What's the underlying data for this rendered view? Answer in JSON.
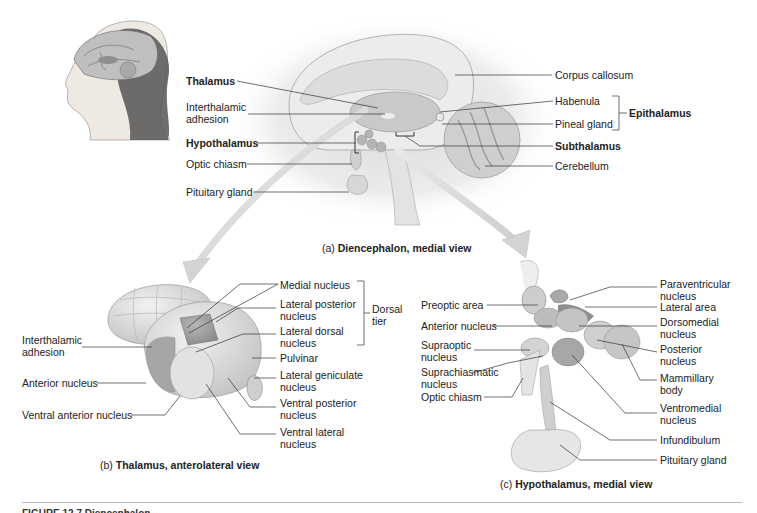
{
  "figure": {
    "caption_cut": "FIGURE 12.7 Diencephalon.",
    "colors": {
      "background": "#ffffff",
      "tissue_light": "#e6e6e6",
      "tissue_mid": "#c8c8c8",
      "tissue_dark": "#9a9a9a",
      "leader_line": "#333333",
      "arrow_fill": "#dcdcdc"
    }
  },
  "panel_a": {
    "caption_prefix": "(a)",
    "caption_bold": "Diencephalon, medial view",
    "labels_left": {
      "thalamus": "Thalamus",
      "interthalamic_adhesion": "Interthalamic\nadhesion",
      "hypothalamus": "Hypothalamus",
      "optic_chiasm": "Optic chiasm",
      "pituitary_gland": "Pituitary gland"
    },
    "labels_right": {
      "corpus_callosum": "Corpus callosum",
      "habenula": "Habenula",
      "pineal_gland": "Pineal gland",
      "epithalamus": "Epithalamus",
      "subthalamus": "Subthalamus",
      "cerebellum": "Cerebellum"
    }
  },
  "panel_b": {
    "caption_prefix": "(b)",
    "caption_bold": "Thalamus, anterolateral view",
    "labels_left": {
      "interthalamic_adhesion": "Interthalamic\nadhesion",
      "anterior_nucleus": "Anterior nucleus",
      "ventral_anterior_nucleus": "Ventral anterior nucleus"
    },
    "labels_right": {
      "medial_nucleus": "Medial nucleus",
      "lateral_posterior_nucleus": "Lateral posterior\nnucleus",
      "lateral_dorsal_nucleus": "Lateral dorsal\nnucleus",
      "pulvinar": "Pulvinar",
      "lateral_geniculate_nucleus": "Lateral geniculate\nnucleus",
      "ventral_posterior_nucleus": "Ventral posterior\nnucleus",
      "ventral_lateral_nucleus": "Ventral lateral\nnucleus"
    },
    "bracket_label": "Dorsal\ntier"
  },
  "panel_c": {
    "caption_prefix": "(c)",
    "caption_bold": "Hypothalamus, medial view",
    "labels_left": {
      "preoptic_area": "Preoptic area",
      "anterior_nucleus": "Anterior nucleus",
      "supraoptic_nucleus": "Supraoptic\nnucleus",
      "suprachiasmatic_nucleus": "Suprachiasmatic\nnucleus",
      "optic_chiasm": "Optic chiasm"
    },
    "labels_right": {
      "paraventricular_nucleus": "Paraventricular\nnucleus",
      "lateral_area": "Lateral area",
      "dorsomedial_nucleus": "Dorsomedial\nnucleus",
      "posterior_nucleus": "Posterior\nnucleus",
      "mammillary_body": "Mammillary\nbody",
      "ventromedial_nucleus": "Ventromedial\nnucleus",
      "infundibulum": "Infundibulum",
      "pituitary_gland": "Pituitary gland"
    }
  }
}
